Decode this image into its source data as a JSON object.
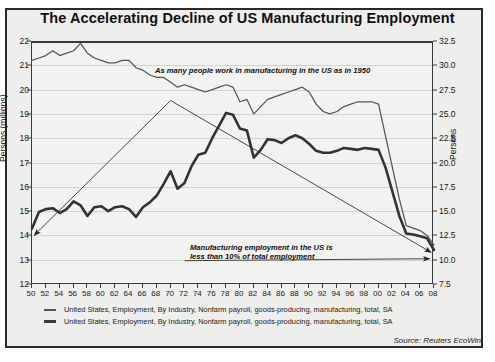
{
  "title": "The Accelerating Decline of US Manufacturing Employment",
  "source": "Source: Reuters EcoWin",
  "axis": {
    "left_label": "Persons (millions)",
    "right_label": "Persons",
    "left_ticks": [
      "22",
      "21",
      "20",
      "19",
      "18",
      "17",
      "16",
      "15",
      "14",
      "13",
      "12"
    ],
    "right_ticks": [
      "32.5",
      "30.0",
      "27.5",
      "25.0",
      "22.5",
      "20.0",
      "17.5",
      "15.0",
      "12.5",
      "10.0",
      "7.5"
    ],
    "x_ticks": [
      "50",
      "52",
      "54",
      "56",
      "58",
      "60",
      "62",
      "64",
      "66",
      "68",
      "70",
      "72",
      "74",
      "76",
      "78",
      "80",
      "82",
      "84",
      "86",
      "88",
      "90",
      "92",
      "94",
      "96",
      "98",
      "00",
      "02",
      "04",
      "06",
      "08"
    ]
  },
  "annotations": {
    "a1": "As many people work in manufacturing in the US as in 1950",
    "a2_line1": "Manufacturing employment in the US is",
    "a2_line2": "less than 10% of total employment"
  },
  "legend": [
    "United States, Employment, By Industry, Nonfarm payroll, goods-producing, manufacturing, total, SA",
    "United States, Employment, By Industry, Nonfarm payroll, goods-producing, manufacturing, total, SA"
  ],
  "colors": {
    "thin": "#555555",
    "thick": "#333333",
    "grid": "#d2d2cf",
    "frame": "#2a2a2a"
  },
  "chart_data": {
    "type": "line",
    "title": "The Accelerating Decline of US Manufacturing Employment",
    "xlabel": "",
    "ylabel": "Persons (millions)",
    "ylabel_right": "Persons",
    "xlim": [
      1950,
      2008
    ],
    "ylim": [
      12,
      22
    ],
    "ylim_right": [
      7.5,
      32.5
    ],
    "grid": true,
    "legend_position": "below",
    "series": [
      {
        "name": "United States, Employment, By Industry, Nonfarm payroll, goods-producing, manufacturing, total, SA",
        "axis": "left",
        "style": "thin",
        "x": [
          1950,
          1951,
          1952,
          1953,
          1954,
          1955,
          1956,
          1957,
          1958,
          1959,
          1960,
          1961,
          1962,
          1963,
          1964,
          1965,
          1966,
          1967,
          1968,
          1969,
          1970,
          1971,
          1972,
          1973,
          1974,
          1975,
          1976,
          1977,
          1978,
          1979,
          1980,
          1981,
          1982,
          1983,
          1984,
          1985,
          1986,
          1987,
          1988,
          1989,
          1990,
          1991,
          1992,
          1993,
          1994,
          1995,
          1996,
          1997,
          1998,
          1999,
          2000,
          2001,
          2002,
          2003,
          2004,
          2005,
          2006,
          2007,
          2008
        ],
        "y": [
          21.2,
          21.3,
          21.4,
          21.6,
          21.4,
          21.5,
          21.6,
          21.9,
          21.5,
          21.3,
          21.2,
          21.1,
          21.1,
          21.2,
          21.2,
          20.9,
          20.8,
          20.6,
          20.5,
          20.5,
          20.3,
          20.1,
          20.2,
          20.1,
          20.0,
          19.9,
          20.0,
          20.1,
          20.2,
          20.1,
          19.5,
          19.6,
          19.0,
          19.3,
          19.6,
          19.7,
          19.8,
          19.9,
          20.0,
          20.1,
          19.9,
          19.4,
          19.1,
          19.0,
          19.1,
          19.3,
          19.4,
          19.5,
          19.5,
          19.5,
          19.4,
          18.1,
          16.8,
          15.5,
          14.4,
          14.3,
          14.2,
          14.0,
          13.6
        ]
      },
      {
        "name": "United States, Employment, By Industry, Nonfarm payroll, goods-producing, manufacturing, total, SA",
        "axis": "right",
        "style": "thick",
        "x": [
          1950,
          1951,
          1952,
          1953,
          1954,
          1955,
          1956,
          1957,
          1958,
          1959,
          1960,
          1961,
          1962,
          1963,
          1964,
          1965,
          1966,
          1967,
          1968,
          1969,
          1970,
          1971,
          1972,
          1973,
          1974,
          1975,
          1976,
          1977,
          1978,
          1979,
          1980,
          1981,
          1982,
          1983,
          1984,
          1985,
          1986,
          1987,
          1988,
          1989,
          1990,
          1991,
          1992,
          1993,
          1994,
          1995,
          1996,
          1997,
          1998,
          1999,
          2000,
          2001,
          2002,
          2003,
          2004,
          2005,
          2006,
          2007,
          2008
        ],
        "y_right": [
          13.2,
          14.9,
          15.2,
          15.3,
          14.8,
          15.2,
          16.0,
          15.6,
          14.5,
          15.4,
          15.5,
          15.0,
          15.4,
          15.5,
          15.2,
          14.4,
          15.4,
          15.9,
          16.6,
          17.8,
          19.1,
          17.3,
          17.9,
          19.6,
          20.8,
          21.0,
          22.5,
          23.8,
          25.1,
          24.9,
          23.5,
          23.3,
          20.5,
          21.3,
          22.4,
          22.3,
          22.0,
          22.5,
          22.8,
          22.5,
          21.9,
          21.2,
          21.0,
          21.0,
          21.2,
          21.5,
          21.4,
          21.3,
          21.5,
          21.4,
          21.3,
          19.5,
          17.0,
          14.5,
          12.7,
          12.6,
          12.4,
          12.2,
          11.0
        ]
      }
    ],
    "annotations": [
      {
        "text": "As many people work in manufacturing in the US as in 1950",
        "arrow_from": [
          1970,
          19.5
        ],
        "arrow_to_left": [
          1950,
          14.0
        ],
        "arrow_to_right": [
          2008,
          12.5
        ]
      },
      {
        "text": "Manufacturing employment in the US is less than 10% of total employment",
        "arrow_to": [
          2008,
          10.0
        ]
      }
    ]
  }
}
